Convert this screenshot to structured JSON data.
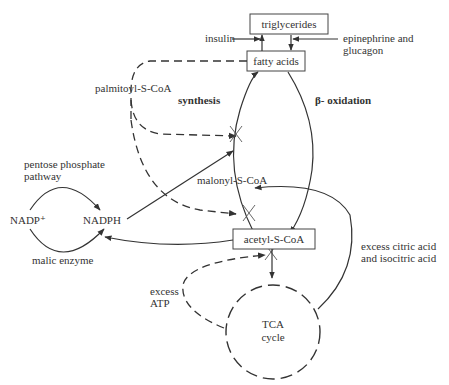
{
  "diagram": {
    "nodes": {
      "triglycerides": "triglycerides",
      "fatty_acids": "fatty acids",
      "acetyl_coa": "acetyl-S-CoA",
      "malonyl_coa": "malonyl-S-CoA",
      "nadp": "NADP⁺",
      "nadph": "NADPH",
      "tca_1": "TCA",
      "tca_2": "cycle"
    },
    "labels": {
      "insulin": "insulin",
      "epinephrine_1": "epinephrine and",
      "epinephrine_2": "glucagon",
      "palmitoyl": "palmitoyl-S-CoA",
      "synthesis": "synthesis",
      "beta_oxidation": "β- oxidation",
      "pentose_1": "pentose phosphate",
      "pentose_2": "pathway",
      "malic": "malic enzyme",
      "citric_1": "excess citric acid",
      "citric_2": "and isocitric acid",
      "atp_1": "excess",
      "atp_2": "ATP"
    }
  }
}
